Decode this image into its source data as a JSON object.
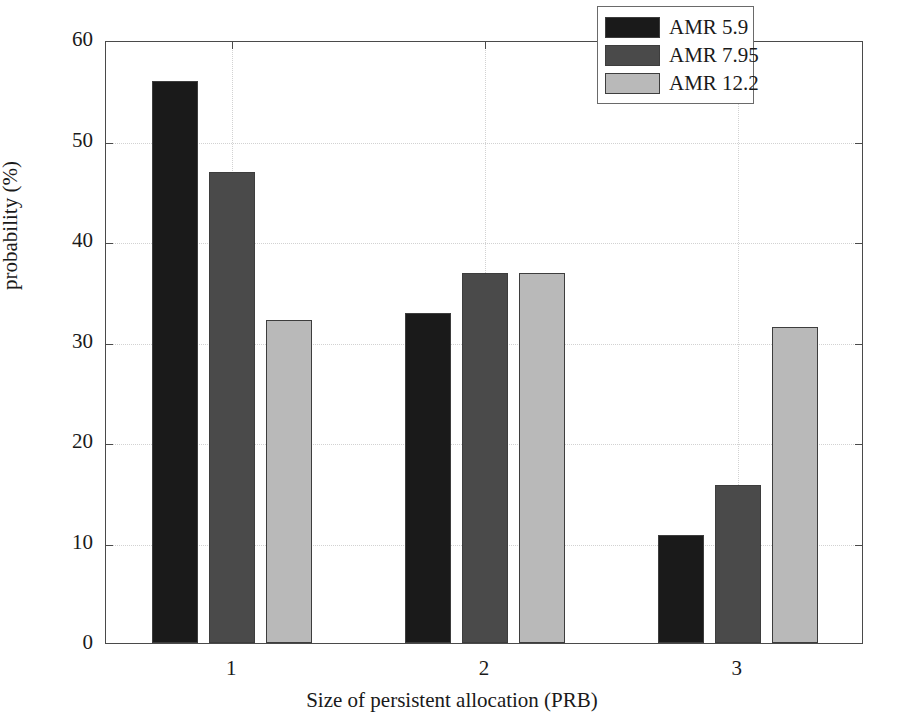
{
  "chart_data": {
    "type": "bar",
    "title": "",
    "xlabel": "Size of persistent allocation (PRB)",
    "ylabel": "probability (%)",
    "categories": [
      "1",
      "2",
      "3"
    ],
    "series": [
      {
        "name": "AMR 5.9",
        "color": "#1a1a1a",
        "values": [
          55.9,
          32.8,
          10.7
        ]
      },
      {
        "name": "AMR 7.95",
        "color": "#4a4a4a",
        "values": [
          46.9,
          36.8,
          15.7
        ]
      },
      {
        "name": "AMR 12.2",
        "color": "#b9b9b9",
        "values": [
          32.1,
          36.8,
          31.4
        ]
      }
    ],
    "ylim": [
      0,
      60
    ],
    "yticks": [
      0,
      10,
      20,
      30,
      40,
      50,
      60
    ],
    "ytick_labels": [
      "0",
      "10",
      "20",
      "30",
      "40",
      "50",
      "60"
    ],
    "xtick_labels": [
      "1",
      "2",
      "3"
    ],
    "grid": true,
    "legend_position": "top-right",
    "legend_entries": [
      "AMR 5.9",
      "AMR 7.95",
      "AMR 12.2"
    ]
  }
}
